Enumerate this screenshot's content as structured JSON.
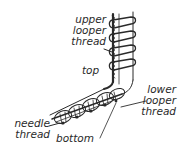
{
  "diagram": {
    "labels": {
      "upper_looper": [
        "upper",
        "looper",
        "thread"
      ],
      "top": "top",
      "lower_looper": [
        "lower",
        "looper",
        "thread"
      ],
      "needle": [
        "needle",
        "thread"
      ],
      "bottom": "bottom"
    },
    "colors": {
      "ink": "#2a2a2a",
      "background": "#ffffff"
    }
  }
}
